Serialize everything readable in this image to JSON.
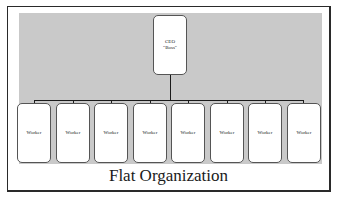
{
  "diagram": {
    "title": "Flat Organization",
    "top_node": {
      "line1": "CEO",
      "line2": "\"Boss\""
    },
    "workers": [
      {
        "label": "Worker"
      },
      {
        "label": "Worker"
      },
      {
        "label": "Worker"
      },
      {
        "label": "Worker"
      },
      {
        "label": "Worker"
      },
      {
        "label": "Worker"
      },
      {
        "label": "Worker"
      },
      {
        "label": "Worker"
      }
    ],
    "colors": {
      "background_panel": "#c9c9c9",
      "box_fill": "#ffffff",
      "connector": "#1a1a1a",
      "frame": "#2a2a2a"
    }
  }
}
